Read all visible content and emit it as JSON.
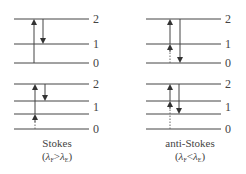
{
  "diagram": {
    "panels": [
      {
        "id": "stokes",
        "caption": "Stokes",
        "condition": {
          "lhs": "λ",
          "lhs_sub": "F",
          "op": ">",
          "rhs": "λ",
          "rhs_sub": "E"
        },
        "diagrams": [
          {
            "levels": [
              "2",
              "1",
              "0"
            ],
            "transitions": [
              {
                "type": "absorption",
                "from": "0",
                "to": "2",
                "style": "solid"
              },
              {
                "type": "emission",
                "from": "2",
                "to": "1",
                "style": "solid"
              }
            ]
          },
          {
            "levels": [
              "2",
              "",
              "1",
              "0"
            ],
            "transitions": [
              {
                "type": "absorption",
                "from": "0",
                "to": "2",
                "style": "dotted-then-solid"
              },
              {
                "type": "emission",
                "from": "2",
                "to": "1",
                "style": "solid"
              }
            ]
          }
        ]
      },
      {
        "id": "anti-stokes",
        "caption": "anti-Stokes",
        "condition": {
          "lhs": "λ",
          "lhs_sub": "F",
          "op": "<",
          "rhs": "λ",
          "rhs_sub": "E"
        },
        "diagrams": [
          {
            "levels": [
              "2",
              "1",
              "0"
            ],
            "transitions": [
              {
                "type": "absorption",
                "from": "1",
                "to": "2",
                "style": "solid",
                "note": "thermally populated from 0 (dotted)"
              },
              {
                "type": "emission",
                "from": "2",
                "to": "0",
                "style": "solid"
              }
            ]
          },
          {
            "levels": [
              "2",
              "1",
              "",
              "0"
            ],
            "transitions": [
              {
                "type": "absorption",
                "from": "1",
                "to": "2",
                "style": "solid",
                "note": "thermally populated from 0 (dotted)"
              },
              {
                "type": "emission",
                "from": "2",
                "to": "",
                "style": "solid"
              }
            ]
          }
        ]
      }
    ],
    "level_labels": {
      "two": "2",
      "one": "1",
      "zero": "0"
    }
  }
}
